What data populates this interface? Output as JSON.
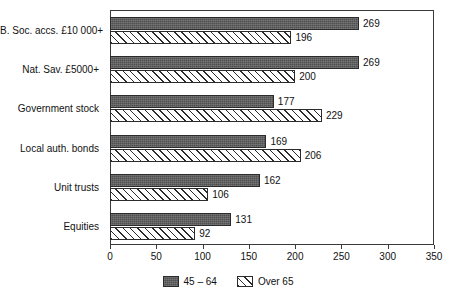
{
  "chart_data": {
    "type": "bar",
    "orientation": "horizontal",
    "title": "",
    "xlabel": "",
    "ylabel": "",
    "xlim": [
      0,
      350
    ],
    "xticks": [
      0,
      50,
      100,
      150,
      200,
      250,
      300,
      350
    ],
    "grid": false,
    "legend_position": "bottom-center",
    "categories": [
      "B. Soc. accs. £10 000+",
      "Nat. Sav. £5000+",
      "Government stock",
      "Local auth. bonds",
      "Unit trusts",
      "Equities"
    ],
    "series": [
      {
        "name": "45 – 64",
        "style": "solid-dark",
        "color": "#4f4f4f",
        "values": [
          269,
          269,
          177,
          169,
          162,
          131
        ]
      },
      {
        "name": "Over 65",
        "style": "hatched",
        "color": "#ffffff",
        "values": [
          196,
          200,
          229,
          206,
          106,
          92
        ]
      }
    ]
  },
  "legend": {
    "items": [
      {
        "label": "45 – 64",
        "swatch": "solid-dark-swatch"
      },
      {
        "label": "Over 65",
        "swatch": "hatched-swatch"
      }
    ]
  },
  "axis": {
    "tick_labels": [
      "0",
      "50",
      "100",
      "150",
      "200",
      "250",
      "300",
      "350"
    ]
  }
}
